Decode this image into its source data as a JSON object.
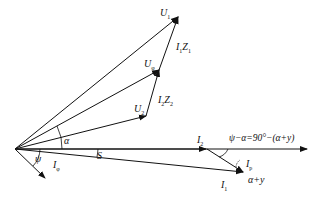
{
  "diagram": {
    "type": "phasor-diagram",
    "colors": {
      "line": "#111111",
      "background": "#ffffff"
    },
    "labels": {
      "U1": {
        "main": "U",
        "sub": "1"
      },
      "Uphi": {
        "main": "U",
        "sub": "φ"
      },
      "U2": {
        "main": "U",
        "sub": "2"
      },
      "I1Z1": {
        "main": "I",
        "sub1": "1",
        "main2": "Z",
        "sub2": "1"
      },
      "I2Z2": {
        "main": "I",
        "sub1": "2",
        "main2": "Z",
        "sub2": "2"
      },
      "I2": {
        "main": "I",
        "sub": "2"
      },
      "I1": {
        "main": "I",
        "sub": "1"
      },
      "Iphi_left": {
        "main": "I",
        "sub": "φ"
      },
      "Iphi_right": {
        "main": "I",
        "sub": "p"
      },
      "alpha": "α",
      "psi": "ψ",
      "S": "S",
      "equation": "ψ−α=90°−(α+y)",
      "alpha_plus_y": "α+y"
    }
  }
}
